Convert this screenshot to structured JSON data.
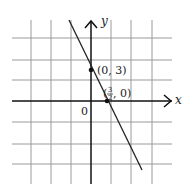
{
  "graph": {
    "axes": {
      "x_label": "x",
      "y_label": "y",
      "origin_label": "0"
    },
    "grid": {
      "x_lines": [
        31,
        51,
        71,
        111,
        131,
        152
      ],
      "y_lines": [
        38,
        60,
        80,
        122,
        144,
        164
      ]
    },
    "line": {
      "x1": 69,
      "y1": 20,
      "x2": 142,
      "y2": 170
    },
    "points": [
      {
        "label": "(0, 3)",
        "cx": 91,
        "cy": 70
      },
      {
        "label_open": "(",
        "frac_num": "3",
        "frac_den": "2",
        "label_close": ", 0)",
        "cx": 107,
        "cy": 101
      }
    ],
    "colors": {
      "grid": "#9a9a9a",
      "axis": "#111111",
      "line": "#222222"
    }
  }
}
